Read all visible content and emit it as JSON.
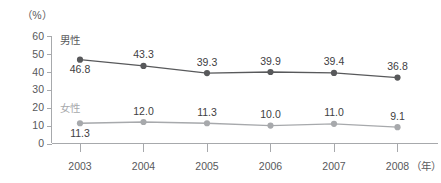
{
  "chart_data": {
    "type": "line",
    "title": "",
    "subtitle": "",
    "xlabel": "（年）",
    "ylabel": "（%）",
    "categories": [
      "2003",
      "2004",
      "2005",
      "2006",
      "2007",
      "2008"
    ],
    "x": [
      2003,
      2004,
      2005,
      2006,
      2007,
      2008
    ],
    "ylim": [
      0,
      60
    ],
    "yticks": [
      0,
      10,
      20,
      30,
      40,
      50,
      60
    ],
    "ytick_labels": [
      "0",
      "10",
      "20",
      "30",
      "40",
      "50",
      "60"
    ],
    "grid": false,
    "legend_position": "inline-left",
    "series": [
      {
        "name": "男性",
        "color": "#58595b",
        "marker": "circle",
        "values": [
          46.8,
          43.3,
          39.3,
          39.9,
          39.4,
          36.8
        ],
        "data_labels": [
          "46.8",
          "43.3",
          "39.3",
          "39.9",
          "39.4",
          "36.8"
        ],
        "label_positions": [
          "below",
          "above",
          "above",
          "above",
          "above",
          "above"
        ]
      },
      {
        "name": "女性",
        "color": "#a7a9ac",
        "marker": "circle",
        "values": [
          11.3,
          12.0,
          11.3,
          10.0,
          11.0,
          9.1
        ],
        "data_labels": [
          "11.3",
          "12.0",
          "11.3",
          "10.0",
          "11.0",
          "9.1"
        ],
        "label_positions": [
          "below",
          "above",
          "above",
          "above",
          "above",
          "above"
        ]
      }
    ]
  },
  "axes": {
    "unit_top_left": "（%）",
    "unit_bottom_right": "（年）"
  },
  "colors": {
    "male_series": "#58595b",
    "female_series": "#a7a9ac",
    "axis": "#a7a9ac",
    "text": "#58595b",
    "data_label_text": "#414042",
    "background": "#ffffff"
  }
}
